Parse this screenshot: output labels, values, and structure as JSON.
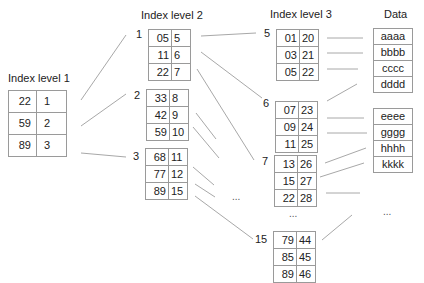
{
  "titles": {
    "level1": "Index level 1",
    "level2": "Index level 2",
    "level3": "Index level 3",
    "data": "Data"
  },
  "level1": {
    "rows": [
      {
        "key": "22",
        "ptr": "1"
      },
      {
        "key": "59",
        "ptr": "2"
      },
      {
        "key": "89",
        "ptr": "3"
      }
    ]
  },
  "level2": {
    "blocks": [
      {
        "label": "1",
        "rows": [
          {
            "key": "05",
            "ptr": "5"
          },
          {
            "key": "11",
            "ptr": "6"
          },
          {
            "key": "22",
            "ptr": "7"
          }
        ]
      },
      {
        "label": "2",
        "rows": [
          {
            "key": "33",
            "ptr": "8"
          },
          {
            "key": "42",
            "ptr": "9"
          },
          {
            "key": "59",
            "ptr": "10"
          }
        ]
      },
      {
        "label": "3",
        "rows": [
          {
            "key": "68",
            "ptr": "11"
          },
          {
            "key": "77",
            "ptr": "12"
          },
          {
            "key": "89",
            "ptr": "15"
          }
        ]
      }
    ],
    "ellipsis": "..."
  },
  "level3": {
    "blocks": [
      {
        "label": "5",
        "rows": [
          {
            "key": "01",
            "ptr": "20"
          },
          {
            "key": "03",
            "ptr": "21"
          },
          {
            "key": "05",
            "ptr": "22"
          }
        ]
      },
      {
        "label": "6",
        "rows": [
          {
            "key": "07",
            "ptr": "23"
          },
          {
            "key": "09",
            "ptr": "24"
          },
          {
            "key": "11",
            "ptr": "25"
          }
        ]
      },
      {
        "label": "7",
        "rows": [
          {
            "key": "13",
            "ptr": "26"
          },
          {
            "key": "15",
            "ptr": "27"
          },
          {
            "key": "22",
            "ptr": "28"
          }
        ]
      },
      {
        "label": "15",
        "rows": [
          {
            "key": "79",
            "ptr": "44"
          },
          {
            "key": "85",
            "ptr": "45"
          },
          {
            "key": "89",
            "ptr": "46"
          }
        ]
      }
    ],
    "ellipsis": "..."
  },
  "data": {
    "blocks": [
      [
        "aaaa",
        "bbbb",
        "cccc",
        "dddd"
      ],
      [
        "eeee",
        "gggg",
        "hhhh",
        "kkkk"
      ]
    ],
    "ellipsis": "..."
  }
}
